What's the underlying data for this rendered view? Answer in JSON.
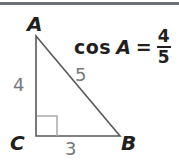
{
  "figure": {
    "rule_color": "#6e7174",
    "stroke_color": "#58595b",
    "label_color": "#231f20",
    "measure_color": "#76787b",
    "background": "#ffffff"
  },
  "triangle": {
    "vertices": [
      {
        "name": "A",
        "label": "A",
        "x": 36,
        "y": 36
      },
      {
        "name": "B",
        "label": "B",
        "x": 120,
        "y": 136
      },
      {
        "name": "C",
        "label": "C",
        "x": 36,
        "y": 136
      }
    ],
    "right_angle_at": "C",
    "sides": [
      {
        "name": "leg-ac",
        "label": "4",
        "from": "A",
        "to": "C"
      },
      {
        "name": "hypotenuse-ab",
        "label": "5",
        "from": "A",
        "to": "B"
      },
      {
        "name": "base-cb",
        "label": "3",
        "from": "C",
        "to": "B"
      }
    ]
  },
  "equation": {
    "function": "cos",
    "angle": "A",
    "equals": "=",
    "numerator": "4",
    "denominator": "5",
    "full_text": "cos A = 4/5"
  }
}
